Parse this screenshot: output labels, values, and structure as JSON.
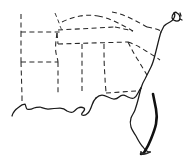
{
  "figure": {
    "kind": "line-art map",
    "width_px": 189,
    "height_px": 167,
    "background_color": "#ffffff"
  },
  "styles": {
    "coastline_color": "#1a1a1a",
    "coastline_width_px": 1.25,
    "heavy_coastline_color": "#111111",
    "heavy_coastline_width_px": 2.6,
    "border_color": "#262626",
    "border_width_px": 1.05,
    "border_dash_pattern": "5 3.4"
  },
  "features": {
    "coastlines": [
      {
        "name": "gulf-coast-texas-louisiana",
        "d": "M 12 116 C 13 112, 16 109, 19 107 C 21 105, 23 104, 25 104 C 26 106, 26 108, 27 109 C 29 110, 32 109, 34 108 C 36 107, 38 107, 40 107 C 43 108, 45 109, 48 109 C 52 109, 56 108, 60 108 C 63 108, 65 109, 67 111 C 69 112, 71 113, 73 112 C 75 111, 76 109, 78 108 C 80 107, 82 107, 84 108 C 85 109, 84 111, 83 112 C 82 113, 81 114, 82 115 C 84 116, 86 115, 88 113 C 90 111, 91 108, 92 105 C 93 102, 94 100, 96 98"
      },
      {
        "name": "gulf-coast-mississippi-alabama-florida-panhandle",
        "d": "M 96 98 C 98 96, 100 95, 102 95 C 104 95, 106 96, 108 97 C 110 98, 112 99, 114 99 C 116 99, 118 98, 119 97 C 120 96, 121 95, 123 95 C 125 95, 126 96, 128 97 C 130 98, 132 99, 134 98 C 136 97, 137 95, 138 93 C 139 91, 140 89, 141 88"
      },
      {
        "name": "florida-peninsula-west-coast",
        "d": "M 141 88 C 140 92, 139 96, 138 100 C 137 104, 136 107, 135 110 C 134 113, 132 115, 131 118 C 130 121, 130 124, 131 127 C 132 130, 134 133, 136 136 C 138 140, 140 144, 143 147 C 145 150, 148 152, 150 152"
      },
      {
        "name": "florida-peninsula-east-coast-heavy",
        "d": "M 153 94 C 154 99, 155 104, 156 109 C 157 114, 157 119, 156 124 C 155 129, 153 134, 151 139 C 149 144, 147 148, 145 151 C 144 153, 143 154, 141 154"
      },
      {
        "name": "florida-keys-tip",
        "d": "M 150 152 C 148 153, 146 154, 144 154 C 142 154, 141 153, 141 152"
      },
      {
        "name": "atlantic-coast-georgia-carolinas",
        "d": "M 141 88 C 142 85, 143 82, 145 79 C 147 75, 149 71, 151 67 C 153 63, 154 59, 155 55 C 156 51, 157 47, 158 43 C 159 39, 160 35, 161 32"
      },
      {
        "name": "atlantic-coast-cape-hatteras-virginia",
        "d": "M 161 32 C 162 30, 163 28, 164 26 C 166 24, 168 23, 170 22 C 172 21, 173 20, 174 18 C 175 16, 175 14, 174 13"
      },
      {
        "name": "chesapeake-bay-delmarva",
        "d": "M 174 13 C 173 14, 172 16, 172 18 C 173 20, 175 21, 177 21 C 179 21, 180 20, 180 18 C 180 16, 179 14, 177 13 C 176 12, 175 12, 174 13 Z"
      },
      {
        "name": "delmarva-outer-tick",
        "d": "M 180 13 L 181 16 M 180 19 L 182 20"
      }
    ],
    "state_borders": [
      {
        "name": "missouri-arkansas-north",
        "d": "M 21 32 L 60 32"
      },
      {
        "name": "arkansas-west-edge",
        "d": "M 21 14 L 21 32"
      },
      {
        "name": "arkansas-louisiana-west",
        "d": "M 21 32 L 21 62"
      },
      {
        "name": "arkansas-louisiana-south",
        "d": "M 21 62 L 58 62"
      },
      {
        "name": "louisiana-west-edge",
        "d": "M 21 62 L 22 96"
      },
      {
        "name": "arkansas-mississippi-east",
        "d": "M 57 33 C 56 40, 55 47, 56 53 C 57 58, 58 60, 58 62"
      },
      {
        "name": "louisiana-mississippi-east",
        "d": "M 58 62 L 58 94"
      },
      {
        "name": "tennessee-kentucky-north",
        "d": "M 58 30 L 115 27"
      },
      {
        "name": "kentucky-missouri-illinois-upper",
        "d": "M 55 13 C 57 18, 59 22, 60 26 C 61 28, 61 29, 62 30"
      },
      {
        "name": "kentucky-north-ohio-river",
        "d": "M 62 22 C 68 19, 74 17, 80 16 C 86 15, 92 15, 98 16"
      },
      {
        "name": "kentucky-virginia-east",
        "d": "M 98 16 C 104 17, 110 19, 116 22 C 122 25, 128 28, 133 31"
      },
      {
        "name": "tennessee-virginia-north-carolina",
        "d": "M 115 27 C 122 28, 128 30, 133 31"
      },
      {
        "name": "virginia-west-virginia-upper",
        "d": "M 112 12 C 118 13, 124 15, 130 18 C 136 21, 142 24, 147 27"
      },
      {
        "name": "virginia-north-potomac",
        "d": "M 147 27 C 152 28, 157 29, 161 31"
      },
      {
        "name": "mississippi-alabama",
        "d": "M 82 44 L 82 93"
      },
      {
        "name": "alabama-georgia",
        "d": "M 104 44 C 104 55, 104 66, 105 76 C 105 84, 106 89, 106 93"
      },
      {
        "name": "tennessee-south-border",
        "d": "M 58 44 L 128 42"
      },
      {
        "name": "georgia-south-carolina",
        "d": "M 128 42 C 131 48, 134 54, 138 60 C 141 65, 144 70, 147 75"
      },
      {
        "name": "north-carolina-south-carolina",
        "d": "M 128 42 C 134 44, 140 47, 146 51 C 151 54, 156 57, 160 60"
      },
      {
        "name": "florida-georgia-north",
        "d": "M 106 93 L 136 91"
      },
      {
        "name": "arkansas-tennessee-mississippi-river",
        "d": "M 57 33 L 58 44"
      },
      {
        "name": "west-louisiana-texas-south",
        "d": "M 22 96 L 22 104"
      }
    ]
  }
}
